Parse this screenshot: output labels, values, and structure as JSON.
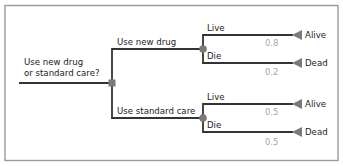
{
  "diagram": {
    "type": "decision-tree",
    "colors": {
      "frame": "#9a9a9a",
      "edge": "#333333",
      "node": "#7a7a7a",
      "probability_text": "#a6a6a6",
      "label_text": "#222222"
    },
    "root": {
      "question_line1": "Use new drug",
      "question_line2": "or standard care?",
      "node_type": "decision-square"
    },
    "branches": [
      {
        "label": "Use new drug",
        "node_type": "chance-circle",
        "outcomes": [
          {
            "label": "Live",
            "terminal": "Alive",
            "probability": "0.8"
          },
          {
            "label": "Die",
            "terminal": "Dead",
            "probability": "0.2"
          }
        ]
      },
      {
        "label": "Use standard care",
        "node_type": "chance-circle",
        "outcomes": [
          {
            "label": "Live",
            "terminal": "Alive",
            "probability": "0.5"
          },
          {
            "label": "Die",
            "terminal": "Dead",
            "probability": "0.5"
          }
        ]
      }
    ]
  }
}
